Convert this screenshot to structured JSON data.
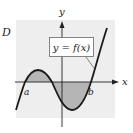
{
  "diagram": {
    "region_label": "D",
    "y_axis_label": "y",
    "x_axis_label": "x",
    "function_label": "y = f(x)",
    "point_a_label": "a",
    "point_b_label": "b",
    "colors": {
      "panel": "#eeeeee",
      "shading": "#b5b5b5",
      "curve": "#1a1a1a",
      "axis": "#222222"
    }
  }
}
